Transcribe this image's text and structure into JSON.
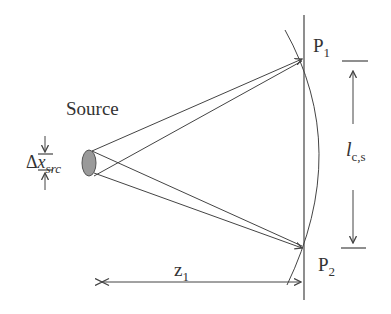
{
  "diagram": {
    "labels": {
      "source": "Source",
      "delta_symbol": "Δ",
      "delta_x": "x",
      "delta_sub": "src",
      "p1": "P",
      "p1_sub": "1",
      "p2": "P",
      "p2_sub": "2",
      "coherence_l": "l",
      "coherence_sub": "c,s",
      "z": "z",
      "z_sub": "1"
    },
    "colors": {
      "line": "#444444",
      "source_fill": "#9a9a9a",
      "text": "#333333"
    }
  }
}
